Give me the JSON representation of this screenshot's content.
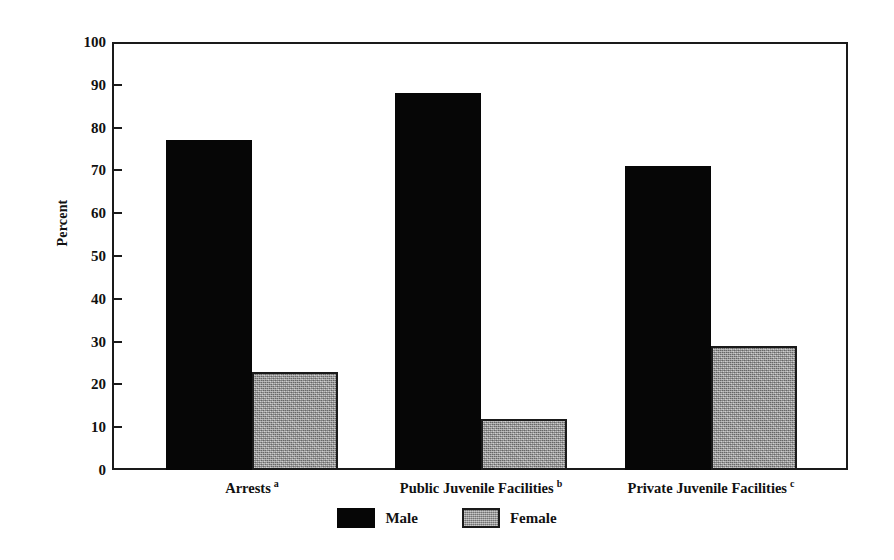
{
  "chart_data": {
    "type": "bar",
    "title": "",
    "xlabel": "",
    "ylabel": "Percent",
    "ylim": [
      0,
      100
    ],
    "yticks": [
      0,
      10,
      20,
      30,
      40,
      50,
      60,
      70,
      80,
      90,
      100
    ],
    "ytick_labels": [
      "0",
      "10",
      "20",
      "30",
      "40",
      "50",
      "60",
      "70",
      "80",
      "90",
      "100"
    ],
    "grid": false,
    "legend_position": "bottom-center",
    "categories": [
      {
        "label": "Arrests",
        "footnote": "a"
      },
      {
        "label": "Public Juvenile Facilities",
        "footnote": "b"
      },
      {
        "label": "Private Juvenile Facilities",
        "footnote": "c"
      }
    ],
    "category_labels": [
      "Arrests",
      "Public Juvenile Facilities",
      "Private Juvenile Facilities"
    ],
    "series": [
      {
        "name": "Male",
        "color": "#060606",
        "values": [
          77,
          88,
          71
        ]
      },
      {
        "name": "Female",
        "color": "#9b9b9b",
        "values": [
          23,
          12,
          29
        ]
      }
    ],
    "legend": [
      {
        "label": "Male",
        "swatch": "black-solid"
      },
      {
        "label": "Female",
        "swatch": "gray-textured"
      }
    ]
  },
  "axes": {
    "frame_color": "#1a1a1a",
    "tick_direction": "inward"
  }
}
